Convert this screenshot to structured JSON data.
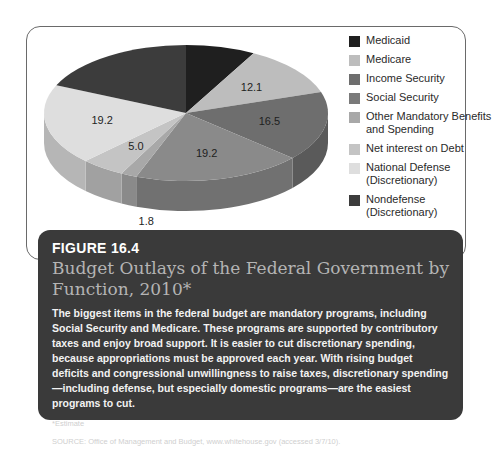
{
  "chart_data": {
    "type": "pie",
    "title": "Budget Outlays of the Federal Government by Function, 2010*",
    "three_d": true,
    "unit": "percent",
    "categories": [
      "Medicaid",
      "Medicare",
      "Income Security",
      "Social Security",
      "Other Mandatory Benefits and Spending",
      "Net interest on Debt",
      "National Defense (Discretionary)",
      "Nondefense (Discretionary)"
    ],
    "values": [
      7.9,
      12.1,
      16.5,
      19.2,
      1.8,
      5.0,
      19.2,
      18.3
    ],
    "value_labels_shown": [
      "",
      "12.1",
      "16.5",
      "19.2",
      "1.8",
      "5.0",
      "19.2",
      ""
    ],
    "estimated_values_note": "Medicaid and Nondefense slices are unlabeled; values estimated from slice angles",
    "colors": [
      "#1f1f1f",
      "#bdbdbd",
      "#6e6e6e",
      "#8a8a8a",
      "#a8a8a8",
      "#c4c4c4",
      "#dedede",
      "#3c3c3c"
    ],
    "legend_position": "right"
  },
  "legend": {
    "items": [
      {
        "label": "Medicaid",
        "color": "#1f1f1f"
      },
      {
        "label": "Medicare",
        "color": "#bdbdbd"
      },
      {
        "label": "Income Security",
        "color": "#6e6e6e"
      },
      {
        "label": "Social Security",
        "color": "#7a7a7a"
      },
      {
        "label": "Other Mandatory Benefits and Spending",
        "color": "#a8a8a8"
      },
      {
        "label": "Net interest on Debt",
        "color": "#c4c4c4"
      },
      {
        "label": "National Defense (Discretionary)",
        "color": "#dedede"
      },
      {
        "label": "Nondefense (Discretionary)",
        "color": "#3c3c3c"
      }
    ]
  },
  "caption": {
    "figure_number": "FIGURE 16.4",
    "title": "Budget Outlays of the Federal Government by Function, 2010*",
    "body": "The biggest items in the federal budget are mandatory programs, including Social Security and Medicare. These programs are supported by contributory taxes and enjoy broad support. It is easier to cut discretionary spending, because appropriations must be approved each year. With rising budget deficits and congressional unwillingness to raise taxes, discretionary spending—including defense, but especially domestic programs—are the easiest programs to cut.",
    "footnote": "*Estimate",
    "source": "SOURCE: Office of Management and Budget, www.whitehouse.gov (accessed 3/7/10)."
  }
}
